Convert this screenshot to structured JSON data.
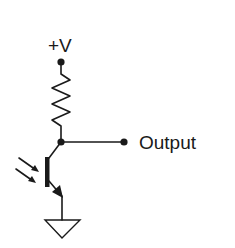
{
  "diagram": {
    "type": "phototransistor-circuit",
    "supply_label": "+V",
    "output_label": "Output",
    "components": [
      {
        "name": "supply-terminal",
        "kind": "terminal"
      },
      {
        "name": "pull-up-resistor",
        "kind": "resistor"
      },
      {
        "name": "phototransistor",
        "kind": "npn-phototransistor"
      },
      {
        "name": "ground",
        "kind": "ground"
      }
    ],
    "colors": {
      "ink": "#1a1a1a",
      "background": "#ffffff"
    }
  }
}
